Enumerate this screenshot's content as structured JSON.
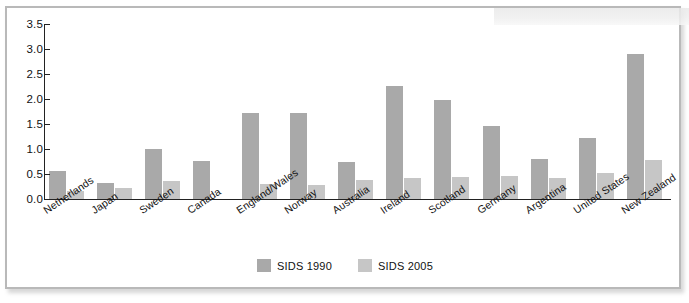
{
  "chart_data": {
    "type": "bar",
    "title": "",
    "subtitle": "",
    "xlabel": "",
    "ylabel": "",
    "ylim": [
      0.0,
      3.5
    ],
    "ytick_labels": [
      "0.0",
      "0.5",
      "1.0",
      "1.5",
      "2.0",
      "2.5",
      "3.0",
      "3.5"
    ],
    "ytick_values": [
      0.0,
      0.5,
      1.0,
      1.5,
      2.0,
      2.5,
      3.0,
      3.5
    ],
    "grid": false,
    "legend_position": "bottom-center",
    "categories": [
      "Netherlands",
      "Japan",
      "Sweden",
      "Canada",
      "England/Wales",
      "Norway",
      "Australia",
      "Ireland",
      "Scotland",
      "Germany",
      "Argentina",
      "United States",
      "New Zealand"
    ],
    "series": [
      {
        "name": "SIDS 1990",
        "color": "#a9a9a9",
        "values": [
          0.57,
          0.33,
          1.0,
          0.76,
          1.72,
          1.72,
          0.74,
          2.27,
          1.98,
          1.46,
          0.81,
          1.22,
          2.9
        ]
      },
      {
        "name": "SIDS 2005",
        "color": "#c6c6c6",
        "values": [
          0.17,
          0.23,
          0.36,
          0.0,
          0.31,
          0.28,
          0.39,
          0.42,
          0.44,
          0.46,
          0.43,
          0.53,
          0.79
        ]
      }
    ]
  },
  "legend": {
    "items": [
      {
        "label": "SIDS 1990",
        "color": "#a9a9a9"
      },
      {
        "label": "SIDS 2005",
        "color": "#c6c6c6"
      }
    ]
  },
  "colors": {
    "series_1990": "#a9a9a9",
    "series_2005": "#c6c6c6",
    "axis": "#222222",
    "frame_border": "#b9b9b9",
    "background": "#ffffff",
    "text": "#111111"
  }
}
